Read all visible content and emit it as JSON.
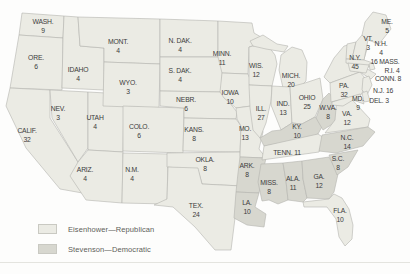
{
  "figure": {
    "kind": "United States electoral-vote map, Eisenhower vs. Stevenson",
    "background": "#fdfdfc",
    "border_color": "#b4b4ae",
    "label_color": "#3b3b3b"
  },
  "legend": {
    "items": [
      {
        "party": "R",
        "label": "Eisenhower—Republican",
        "color": "#ebebe4"
      },
      {
        "party": "D",
        "label": "Stevenson—Democratic",
        "color": "#d7d7cf"
      }
    ]
  },
  "map": {
    "states": [
      {
        "id": "WA",
        "abbr": "WASH.",
        "votes": "9",
        "party": "R",
        "x": 43,
        "y": 26
      },
      {
        "id": "OR",
        "abbr": "ORE.",
        "votes": "6",
        "party": "R",
        "x": 36,
        "y": 62
      },
      {
        "id": "CA",
        "abbr": "CALIF.",
        "votes": "32",
        "party": "R",
        "x": 27,
        "y": 135
      },
      {
        "id": "ID",
        "abbr": "IDAHO",
        "votes": "4",
        "party": "R",
        "x": 78,
        "y": 74
      },
      {
        "id": "NV",
        "abbr": "NEV.",
        "votes": "3",
        "party": "R",
        "x": 58,
        "y": 113
      },
      {
        "id": "UT",
        "abbr": "UTAH",
        "votes": "4",
        "party": "R",
        "x": 95,
        "y": 122
      },
      {
        "id": "AZ",
        "abbr": "ARIZ.",
        "votes": "4",
        "party": "R",
        "x": 85,
        "y": 174
      },
      {
        "id": "MT",
        "abbr": "MONT.",
        "votes": "4",
        "party": "R",
        "x": 118,
        "y": 46
      },
      {
        "id": "WY",
        "abbr": "WYO.",
        "votes": "3",
        "party": "R",
        "x": 128,
        "y": 87
      },
      {
        "id": "CO",
        "abbr": "COLO.",
        "votes": "6",
        "party": "R",
        "x": 139,
        "y": 131
      },
      {
        "id": "NM",
        "abbr": "N.M.",
        "votes": "4",
        "party": "R",
        "x": 132,
        "y": 174
      },
      {
        "id": "ND",
        "abbr": "N. DAK.",
        "votes": "4",
        "party": "R",
        "x": 180,
        "y": 45
      },
      {
        "id": "SD",
        "abbr": "S. DAK.",
        "votes": "4",
        "party": "R",
        "x": 180,
        "y": 75
      },
      {
        "id": "NE",
        "abbr": "NEBR.",
        "votes": "6",
        "party": "R",
        "x": 186,
        "y": 104
      },
      {
        "id": "KS",
        "abbr": "KANS.",
        "votes": "8",
        "party": "R",
        "x": 194,
        "y": 134
      },
      {
        "id": "OK",
        "abbr": "OKLA.",
        "votes": "8",
        "party": "R",
        "x": 205,
        "y": 164
      },
      {
        "id": "TX",
        "abbr": "TEX.",
        "votes": "24",
        "party": "R",
        "x": 196,
        "y": 210
      },
      {
        "id": "MN",
        "abbr": "MINN.",
        "votes": "11",
        "party": "R",
        "x": 222,
        "y": 58
      },
      {
        "id": "IA",
        "abbr": "IOWA",
        "votes": "10",
        "party": "R",
        "x": 230,
        "y": 97
      },
      {
        "id": "MO",
        "abbr": "MO.",
        "votes": "13",
        "party": "R",
        "x": 245,
        "y": 133
      },
      {
        "id": "AR",
        "abbr": "ARK.",
        "votes": "8",
        "party": "D",
        "x": 247,
        "y": 170
      },
      {
        "id": "LA",
        "abbr": "LA.",
        "votes": "10",
        "party": "D",
        "x": 247,
        "y": 207
      },
      {
        "id": "WI",
        "abbr": "WIS.",
        "votes": "12",
        "party": "R",
        "x": 256,
        "y": 70
      },
      {
        "id": "IL",
        "abbr": "ILL.",
        "votes": "27",
        "party": "R",
        "x": 261,
        "y": 113
      },
      {
        "id": "MS",
        "abbr": "MISS.",
        "votes": "8",
        "party": "D",
        "x": 269,
        "y": 187
      },
      {
        "id": "MI",
        "abbr": "MICH.",
        "votes": "20",
        "party": "R",
        "x": 291,
        "y": 80
      },
      {
        "id": "IN",
        "abbr": "IND.",
        "votes": "13",
        "party": "R",
        "x": 283,
        "y": 108
      },
      {
        "id": "OH",
        "abbr": "OHIO",
        "votes": "25",
        "party": "R",
        "x": 307,
        "y": 102
      },
      {
        "id": "KY",
        "abbr": "KY.",
        "votes": "10",
        "party": "D",
        "x": 297,
        "y": 131
      },
      {
        "id": "TN",
        "abbr": "TENN.",
        "votes": "11",
        "party": "R",
        "x": 287,
        "y": 152,
        "inline": true
      },
      {
        "id": "AL",
        "abbr": "ALA.",
        "votes": "11",
        "party": "D",
        "x": 293,
        "y": 183
      },
      {
        "id": "GA",
        "abbr": "GA.",
        "votes": "12",
        "party": "D",
        "x": 319,
        "y": 181
      },
      {
        "id": "WV",
        "abbr": "W.VA.",
        "votes": "8",
        "party": "D",
        "x": 328,
        "y": 112
      },
      {
        "id": "VA",
        "abbr": "VA.",
        "votes": "12",
        "party": "R",
        "x": 347,
        "y": 118
      },
      {
        "id": "NC",
        "abbr": "N.C.",
        "votes": "14",
        "party": "D",
        "x": 347,
        "y": 142
      },
      {
        "id": "SC",
        "abbr": "S.C.",
        "votes": "8",
        "party": "D",
        "x": 338,
        "y": 163
      },
      {
        "id": "FL",
        "abbr": "FLA.",
        "votes": "10",
        "party": "R",
        "x": 340,
        "y": 215
      },
      {
        "id": "PA",
        "abbr": "PA.",
        "votes": "32",
        "party": "R",
        "x": 344,
        "y": 90
      },
      {
        "id": "NY",
        "abbr": "N.Y.",
        "votes": "45",
        "party": "R",
        "x": 355,
        "y": 62
      },
      {
        "id": "ME",
        "abbr": "ME.",
        "votes": "5",
        "party": "R",
        "x": 387,
        "y": 26
      },
      {
        "id": "VT",
        "abbr": "VT.",
        "votes": "3",
        "party": "R",
        "x": 368,
        "y": 43
      },
      {
        "id": "NH",
        "abbr": "N.H.",
        "votes": "4",
        "party": "R",
        "x": 381,
        "y": 48
      },
      {
        "id": "MA",
        "abbr": "MASS.",
        "votes": "16",
        "party": "R",
        "x": 385,
        "y": 61,
        "inline": true,
        "votesFirst": true
      },
      {
        "id": "RI",
        "abbr": "R.I.",
        "votes": "4",
        "party": "R",
        "x": 392,
        "y": 70,
        "inline": true
      },
      {
        "id": "CT",
        "abbr": "CONN.",
        "votes": "8",
        "party": "R",
        "x": 388,
        "y": 78,
        "inline": true
      },
      {
        "id": "NJ",
        "abbr": "N.J.",
        "votes": "16",
        "party": "R",
        "x": 383,
        "y": 90,
        "inline": true
      },
      {
        "id": "MD",
        "abbr": "MD.",
        "votes": "9",
        "party": "R",
        "x": 358,
        "y": 103
      },
      {
        "id": "DE",
        "abbr": "DEL.",
        "votes": "3",
        "party": "R",
        "x": 379,
        "y": 100,
        "inline": true
      }
    ]
  }
}
